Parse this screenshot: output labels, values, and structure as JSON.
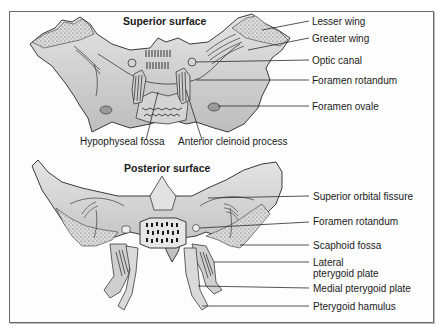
{
  "figure": {
    "panels": [
      {
        "title": "Superior surface",
        "labels": {
          "lesser_wing": "Lesser wing",
          "greater_wing": "Greater wing",
          "optic_canal": "Optic canal",
          "foramen_rotandum": "Foramen rotandum",
          "foramen_ovale": "Foramen ovale",
          "hypophyseal_fossa": "Hypophyseal fossa",
          "anterior_cleinoid_process": "Anterior cleinoid process"
        }
      },
      {
        "title": "Posterior surface",
        "labels": {
          "superior_orbital_fissure": "Superior orbital fissure",
          "foramen_rotandum": "Foramen rotandum",
          "scaphoid_fossa": "Scaphoid fossa",
          "lateral_pterygoid_plate_line1": "Lateral",
          "lateral_pterygoid_plate_line2": "pterygoid plate",
          "medial_pterygoid_plate": "Medial pterygoid plate",
          "pterygoid_hamulus": "Pterygoid hamulus"
        }
      }
    ],
    "colors": {
      "bone_fill": "#c9c9c9",
      "bone_light": "#e2e2e2",
      "outline": "#3a3a3a",
      "text": "#1a1a1a",
      "frame": "#6a6a6a"
    }
  }
}
